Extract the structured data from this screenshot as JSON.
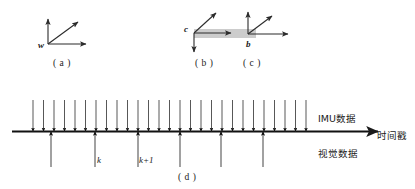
{
  "figure": {
    "type": "diagram"
  },
  "subfigures": {
    "a": {
      "caption": "( a )",
      "frame_label": "w"
    },
    "b": {
      "caption": "( b )",
      "frame_label": "c"
    },
    "c": {
      "caption": "( c )",
      "frame_label": "b"
    },
    "d": {
      "caption": "( d )"
    }
  },
  "timeline": {
    "axis_label": "时间戳",
    "imu_label": "IMU数据",
    "visual_label": "视觉数据",
    "tick_k": "k",
    "tick_k_plus_1": "k+1",
    "imu_tick_count": 27,
    "visual_tick_count": 6,
    "imu_tick_x": [
      33,
      47,
      60,
      74,
      88,
      101,
      115,
      129,
      142,
      156,
      170,
      183,
      197,
      211,
      224,
      238,
      252,
      265,
      279,
      236,
      250,
      264,
      278,
      292,
      299,
      306,
      312
    ],
    "visual_tick_x": [
      51,
      95,
      138,
      180,
      221,
      263
    ]
  },
  "colors": {
    "stroke": "#1a1a1a",
    "axis": "#111111",
    "arrow_thin": "#3a3a3a",
    "bar_fill": "#cccccc",
    "bar_stroke": "#bdbdbd",
    "text": "#1a1a1a",
    "background": "#ffffff"
  }
}
